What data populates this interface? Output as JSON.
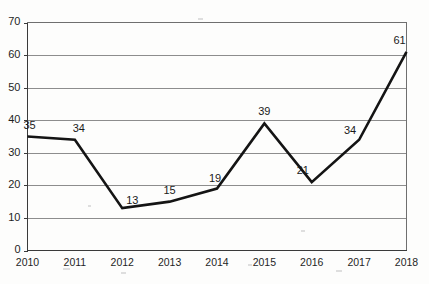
{
  "chart_data": {
    "type": "line",
    "title": "",
    "subtitle": "",
    "xlabel": "",
    "ylabel": "",
    "categories": [
      "2010",
      "2011",
      "2012",
      "2013",
      "2014",
      "2015",
      "2016",
      "2017",
      "2018"
    ],
    "values": [
      35,
      34,
      13,
      15,
      19,
      39,
      21,
      34,
      61
    ],
    "point_labels": [
      "35",
      "34",
      "13",
      "15",
      "19",
      "39",
      "21",
      "34",
      "61"
    ],
    "ylim": [
      0,
      70
    ],
    "ytick_labels": [
      "0",
      "10",
      "20",
      "30",
      "40",
      "50",
      "60",
      "70"
    ],
    "ytick_values": [
      0,
      10,
      20,
      30,
      40,
      50,
      60,
      70
    ],
    "grid": true,
    "grid_axis": "y",
    "legend": false,
    "legend_position": "none",
    "series_color": "#141414",
    "grid_color": "#8d8d8d",
    "axis_color": "#3a3a3a",
    "background_color": "#fdfdfc",
    "annotations": []
  }
}
